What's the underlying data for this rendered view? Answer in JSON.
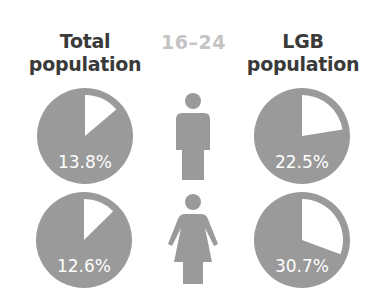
{
  "headers": {
    "total": [
      "Total",
      "population"
    ],
    "age_group": "16–24",
    "lgb": [
      "LGB",
      "population"
    ]
  },
  "colors": {
    "pie_fill": "#9a9a9a",
    "slice": "#ffffff",
    "icon": "#9a9a9a",
    "header_text": "#3a3a3a",
    "age_text": "#c4c4c4"
  },
  "chart_data": {
    "type": "pie",
    "title": "16–24",
    "columns": [
      "Total population",
      "LGB population"
    ],
    "rows": [
      "Male",
      "Female"
    ],
    "values": [
      {
        "row": "Male",
        "column": "Total population",
        "value": 13.8,
        "label": "13.8%"
      },
      {
        "row": "Male",
        "column": "LGB population",
        "value": 22.5,
        "label": "22.5%"
      },
      {
        "row": "Female",
        "column": "Total population",
        "value": 12.6,
        "label": "12.6%"
      },
      {
        "row": "Female",
        "column": "LGB population",
        "value": 30.7,
        "label": "30.7%"
      }
    ]
  },
  "labels": {
    "male_total": "13.8%",
    "male_lgb": "22.5%",
    "female_total": "12.6%",
    "female_lgb": "30.7%"
  },
  "icons": {
    "male": "male-figure-icon",
    "female": "female-figure-icon"
  }
}
